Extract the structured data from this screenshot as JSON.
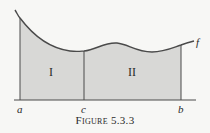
{
  "figure": {
    "caption": "Figure 5.3.3",
    "function_label": "f",
    "axis_labels": [
      "a",
      "c",
      "b"
    ],
    "region_labels": [
      "I",
      "II"
    ],
    "colors": {
      "fill": "#d8d8d6",
      "stroke": "#4a4a4a",
      "background": "#f7f7f5"
    }
  }
}
